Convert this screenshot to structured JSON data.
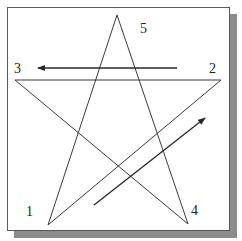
{
  "diagram": {
    "title": "",
    "type": "pentagram-drawing-order",
    "colors": {
      "line": "#3a3a3a",
      "arrow": "#2a2a2a",
      "frame": "#5a5a5a",
      "shadow": "#8c8c8c",
      "background": "#ffffff"
    },
    "vertices": [
      {
        "id": "1",
        "label": "1",
        "x": 48,
        "y": 225,
        "label_x": 26,
        "label_y": 205
      },
      {
        "id": "2",
        "label": "2",
        "x": 221,
        "y": 80,
        "label_x": 209,
        "label_y": 62
      },
      {
        "id": "3",
        "label": "3",
        "x": 15,
        "y": 80,
        "label_x": 14,
        "label_y": 62
      },
      {
        "id": "4",
        "label": "4",
        "x": 188,
        "y": 224,
        "label_x": 191,
        "label_y": 204
      },
      {
        "id": "5",
        "label": "5",
        "x": 117,
        "y": 15,
        "label_x": 140,
        "label_y": 22
      }
    ],
    "edges": [
      {
        "from": "1",
        "to": "2"
      },
      {
        "from": "2",
        "to": "3"
      },
      {
        "from": "3",
        "to": "4"
      },
      {
        "from": "4",
        "to": "5"
      },
      {
        "from": "5",
        "to": "1"
      }
    ],
    "arrows": [
      {
        "name": "arrow-toward-3",
        "x1": 177,
        "y1": 68,
        "x2": 38,
        "y2": 68,
        "direction": "left"
      },
      {
        "name": "arrow-toward-2",
        "x1": 94,
        "y1": 205,
        "x2": 205,
        "y2": 118,
        "direction": "up-right"
      }
    ]
  },
  "labels": {
    "v1": "1",
    "v2": "2",
    "v3": "3",
    "v4": "4",
    "v5": "5"
  }
}
